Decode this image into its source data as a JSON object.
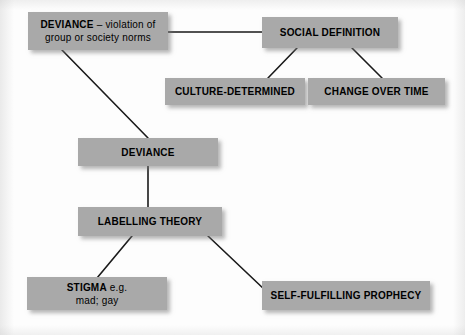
{
  "diagram": {
    "background_color": "#fdfdfd",
    "node_fill_color": "#a9a9a9",
    "node_text_color": "#000000",
    "edge_color": "#1a1a1a",
    "nodes": [
      {
        "id": "deviance-definition",
        "name": "deviance-definition-box",
        "line1_bold": "DEVIANCE",
        "line1_rest": " – violation of",
        "line2": "group or society norms",
        "x": 28,
        "y": 12,
        "w": 140,
        "h": 38
      },
      {
        "id": "social-definition",
        "name": "social-definition-box",
        "label": "SOCIAL DEFINITION",
        "x": 262,
        "y": 17,
        "w": 136,
        "h": 31
      },
      {
        "id": "culture-determined",
        "name": "culture-determined-box",
        "label": "CULTURE-DETERMINED",
        "x": 165,
        "y": 78,
        "w": 140,
        "h": 27
      },
      {
        "id": "change-over-time",
        "name": "change-over-time-box",
        "label": "CHANGE OVER TIME",
        "x": 308,
        "y": 78,
        "w": 137,
        "h": 27
      },
      {
        "id": "deviance",
        "name": "deviance-box",
        "label": "DEVIANCE",
        "x": 78,
        "y": 138,
        "w": 140,
        "h": 28
      },
      {
        "id": "labelling-theory",
        "name": "labelling-theory-box",
        "label": "LABELLING THEORY",
        "x": 78,
        "y": 207,
        "w": 144,
        "h": 29
      },
      {
        "id": "stigma",
        "name": "stigma-box",
        "line1_bold": "STIGMA",
        "line1_rest": " e.g.",
        "line2": "mad; gay",
        "x": 27,
        "y": 277,
        "w": 140,
        "h": 33
      },
      {
        "id": "self-fulfilling-prophecy",
        "name": "self-fulfilling-prophecy-box",
        "label": "SELF-FULFILLING PROPHECY",
        "x": 262,
        "y": 281,
        "w": 168,
        "h": 29
      }
    ],
    "edges": [
      {
        "id": "e1",
        "name": "edge-deviance-definition-to-social-definition",
        "from": "deviance-definition",
        "to": "social-definition",
        "x1": 168,
        "y1": 32,
        "x2": 262,
        "y2": 32
      },
      {
        "id": "e2",
        "name": "edge-deviance-definition-to-deviance",
        "from": "deviance-definition",
        "to": "deviance",
        "x1": 62,
        "y1": 50,
        "x2": 148,
        "y2": 138
      },
      {
        "id": "e3",
        "name": "edge-social-definition-to-culture-determined",
        "from": "social-definition",
        "to": "culture-determined",
        "x1": 297,
        "y1": 48,
        "x2": 268,
        "y2": 78
      },
      {
        "id": "e4",
        "name": "edge-social-definition-to-change-over-time",
        "from": "social-definition",
        "to": "change-over-time",
        "x1": 352,
        "y1": 48,
        "x2": 382,
        "y2": 78
      },
      {
        "id": "e5",
        "name": "edge-deviance-to-labelling-theory",
        "from": "deviance",
        "to": "labelling-theory",
        "x1": 148,
        "y1": 166,
        "x2": 148,
        "y2": 207
      },
      {
        "id": "e6",
        "name": "edge-labelling-theory-to-stigma",
        "from": "labelling-theory",
        "to": "stigma",
        "x1": 132,
        "y1": 236,
        "x2": 97,
        "y2": 278
      },
      {
        "id": "e7",
        "name": "edge-labelling-theory-to-self-fulfilling-prophecy",
        "from": "labelling-theory",
        "to": "self-fulfilling-prophecy",
        "x1": 208,
        "y1": 236,
        "x2": 266,
        "y2": 291
      }
    ]
  }
}
